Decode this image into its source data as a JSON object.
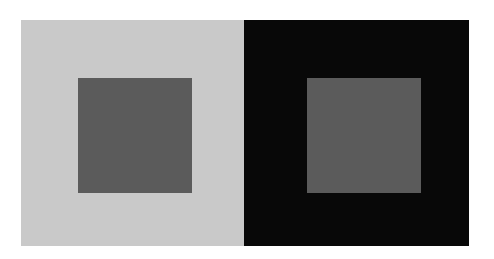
{
  "figure": {
    "type": "simultaneous-contrast-illusion",
    "panels": [
      {
        "name": "left-panel",
        "background_color": "#c9c9c9",
        "inner_square_color": "#5b5b5b"
      },
      {
        "name": "right-panel",
        "background_color": "#080808",
        "inner_square_color": "#5b5b5b"
      }
    ]
  }
}
